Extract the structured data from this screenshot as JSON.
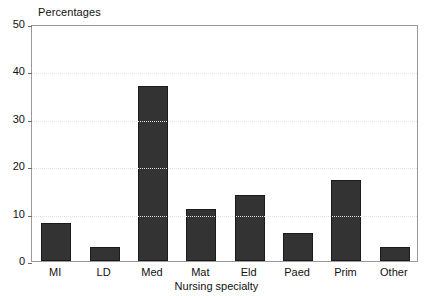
{
  "chart_data": {
    "type": "bar",
    "title": "",
    "ylabel": "Percentages",
    "xlabel": "Nursing specialty",
    "categories": [
      "MI",
      "LD",
      "Med",
      "Mat",
      "Eld",
      "Paed",
      "Prim",
      "Other"
    ],
    "values": [
      8,
      3,
      37,
      11,
      14,
      6,
      17,
      3
    ],
    "ylim": [
      0,
      50
    ],
    "yticks": [
      0,
      10,
      20,
      30,
      40,
      50
    ],
    "ytick_labels": [
      "0",
      "10",
      "20",
      "30",
      "40",
      "50"
    ],
    "grid": true,
    "legend": null,
    "bar_color": "#333333",
    "grid_color": "#e3e3e3",
    "frame_color": "#9a9a9a"
  }
}
